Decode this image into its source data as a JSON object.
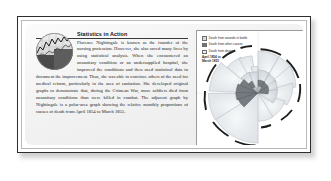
{
  "article": {
    "title": "Statistics in Action",
    "body": "Florence Nightingale is known as the founder of the nursing profession. However, she also saved many lives by using statistical analysis. When she encountered an unsanitary condition or an undersupplied hospital, she improved the conditions and then used statistical data to document the improvement. Thus, she was able to convince others of the need for medical reform, particularly in the area of sanitation. She developed original graphs to demonstrate that, during the Crimean War, more soldiers died from unsanitary conditions than were killed in combat. The adjacent graph by Nightingale is a polar-area graph showing the relative monthly proportions of causes of death from April 1854 to March 1855.",
    "figure_caption": "",
    "figure_icon": "line-graph-photo-icon"
  },
  "chart_panel": {
    "note": "April 1854 to\nMarch 1855",
    "legend": [
      {
        "label": "Death from wounds in battle",
        "color": "#d8dde2"
      },
      {
        "label": "Death from other causes",
        "color": "#6f7478"
      },
      {
        "label": "Death from disease",
        "color": "#eceff2"
      }
    ]
  },
  "chart_data": {
    "type": "pie",
    "subtitle": "April 1854 to March 1855",
    "xlabel": "",
    "ylabel": "",
    "categories": [
      "April 1854",
      "May 1854",
      "June 1854",
      "July 1854",
      "August 1854",
      "September 1854",
      "October 1854",
      "November 1854",
      "December 1854",
      "January 1855",
      "February 1855",
      "March 1855"
    ],
    "series": [
      {
        "name": "Death from disease",
        "color": "#eceff2",
        "values": [
          1,
          12,
          11,
          359,
          828,
          788,
          503,
          844,
          1725,
          2761,
          2120,
          1205
        ]
      },
      {
        "name": "Death from wounds in battle",
        "color": "#d8dde2",
        "values": [
          0,
          0,
          0,
          0,
          1,
          81,
          132,
          287,
          114,
          83,
          42,
          32
        ]
      },
      {
        "name": "Death from other causes",
        "color": "#6f7478",
        "values": [
          5,
          9,
          6,
          23,
          30,
          70,
          128,
          106,
          131,
          324,
          361,
          172
        ]
      }
    ],
    "legend_position": "top-left",
    "grid": false
  }
}
